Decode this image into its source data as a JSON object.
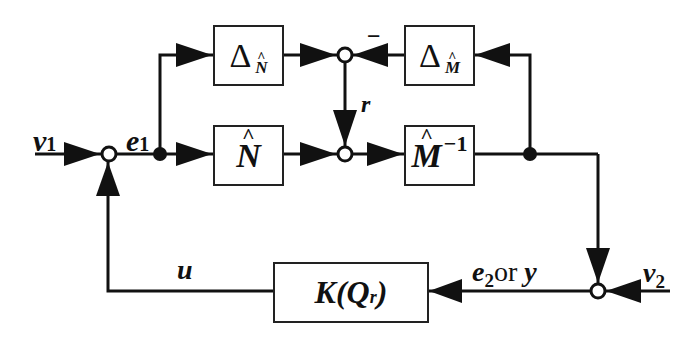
{
  "diagram": {
    "type": "feedback block diagram",
    "blocks": {
      "delta_n": {
        "symbol": "Δ",
        "sub": "N",
        "sub_hat": "^"
      },
      "delta_m": {
        "symbol": "Δ",
        "sub": "M",
        "sub_hat": "^"
      },
      "n_hat": {
        "symbol": "N",
        "hat": "^"
      },
      "m_hat_inv": {
        "symbol": "M",
        "hat": "^",
        "sup": "−1"
      },
      "controller": {
        "label_k": "K(",
        "label_q": "Q",
        "label_sub": "r",
        "label_close": ")"
      }
    },
    "signals": {
      "v1": {
        "base": "v",
        "sub": "1"
      },
      "e1": {
        "base": "e",
        "sub": "1"
      },
      "r": "r",
      "u": "u",
      "e2_or_y": {
        "base": "e",
        "sub": "2",
        "rest": "or ",
        "y": "y"
      },
      "v2": {
        "base": "v",
        "sub": "2"
      }
    },
    "signs": {
      "minus": "−"
    },
    "colors": {
      "line": "#111111",
      "background": "#ffffff"
    }
  }
}
